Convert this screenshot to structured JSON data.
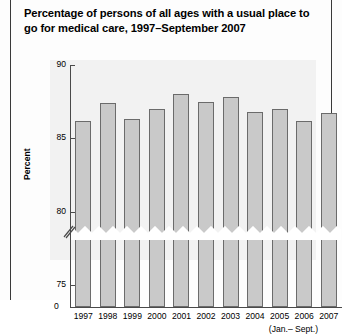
{
  "title": "Percentage of persons of all ages with a usual place to go for medical care, 1997–September 2007",
  "zero_label": "0",
  "footnote": "(Jan.– Sept.)",
  "colors": {
    "bar_fill": "#c9c9c9",
    "bar_outline": "#6b6b6b",
    "panel_bg": "#f2f2f2",
    "axis": "#4a4a4a",
    "rule": "#3a3a3a"
  },
  "chart_data": {
    "type": "bar",
    "title": "Percentage of persons of all ages with a usual place to go for medical care, 1997–September 2007",
    "xlabel": "",
    "ylabel": "Percent",
    "categories": [
      "1997",
      "1998",
      "1999",
      "2000",
      "2001",
      "2002",
      "2003",
      "2004",
      "2005",
      "2006",
      "2007"
    ],
    "values": [
      86.2,
      87.4,
      86.3,
      87.0,
      88.0,
      87.5,
      87.8,
      86.8,
      87.0,
      86.2,
      86.7
    ],
    "ylim": [
      73.5,
      90
    ],
    "yticks": [
      75,
      80,
      85,
      90
    ],
    "ytick_labels": [
      "75",
      "80",
      "85",
      "90"
    ],
    "axis_break": true,
    "axis_break_note": "y-axis broken below 75; bars drawn with zigzag break",
    "grid": false,
    "legend": "none",
    "annotations": [
      "(Jan.– Sept.)"
    ],
    "category_notes": {
      "2007": "(Jan.– Sept.)"
    }
  }
}
